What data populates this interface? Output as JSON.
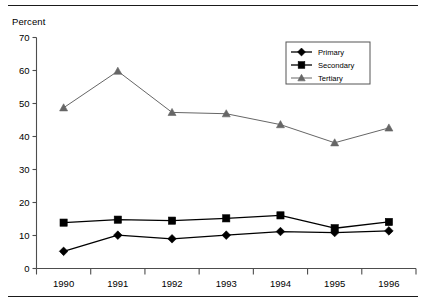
{
  "chart_data": {
    "type": "line",
    "title": "",
    "subtitle": "",
    "ylabel": "Percent",
    "xlabel": "",
    "categories": [
      "1990",
      "1991",
      "1992",
      "1993",
      "1994",
      "1995",
      "1996"
    ],
    "series": [
      {
        "name": "Primary",
        "marker": "diamond",
        "color": "#000000",
        "values": [
          5.2,
          10.1,
          9.0,
          10.1,
          11.2,
          10.9,
          11.4
        ]
      },
      {
        "name": "Secondary",
        "marker": "square",
        "color": "#000000",
        "values": [
          13.9,
          14.8,
          14.5,
          15.2,
          16.1,
          12.2,
          14.1
        ]
      },
      {
        "name": "Tertiary",
        "marker": "triangle",
        "color": "#666666",
        "values": [
          48.7,
          59.8,
          47.3,
          46.9,
          43.6,
          38.1,
          42.6
        ]
      }
    ],
    "ylim": [
      0,
      70
    ],
    "ytick_step": 10,
    "yticks": [
      "0",
      "10",
      "20",
      "30",
      "40",
      "50",
      "60",
      "70"
    ],
    "grid": false,
    "legend_position": "top-right",
    "legend_entries": [
      "Primary",
      "Secondary",
      "Tertiary"
    ]
  },
  "legend": {
    "items": [
      {
        "label": "Primary"
      },
      {
        "label": "Secondary"
      },
      {
        "label": "Tertiary"
      }
    ]
  },
  "axes": {
    "y_title": "Percent",
    "y_tick_labels": [
      "70",
      "60",
      "50",
      "40",
      "30",
      "20",
      "10",
      "0"
    ],
    "x_tick_labels": [
      "1990",
      "1991",
      "1992",
      "1993",
      "1994",
      "1995",
      "1996"
    ]
  },
  "colors": {
    "rule": "#1a1a1a",
    "axis": "#4d4d4d",
    "primary": "#000000",
    "secondary": "#000000",
    "tertiary": "#666666",
    "legend_border": "#555555"
  }
}
